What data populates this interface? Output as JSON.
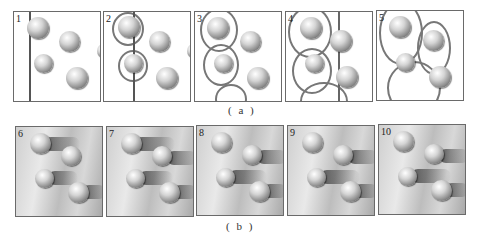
{
  "figure": {
    "row_a": {
      "caption": "( a )",
      "panels": [
        {
          "label": "1"
        },
        {
          "label": "2"
        },
        {
          "label": "3"
        },
        {
          "label": "4"
        },
        {
          "label": "5"
        }
      ]
    },
    "row_b": {
      "caption": "( b )",
      "panels": [
        {
          "label": "6"
        },
        {
          "label": "7"
        },
        {
          "label": "8"
        },
        {
          "label": "9"
        },
        {
          "label": "10"
        }
      ]
    }
  }
}
